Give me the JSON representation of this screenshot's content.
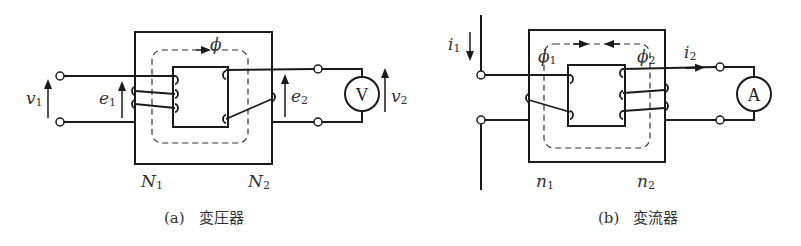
{
  "figure": {
    "panels": [
      {
        "id": "a",
        "caption_letter": "(a)",
        "caption_text": "変圧器",
        "meter_symbol": "V",
        "labels": {
          "input_voltage": "v",
          "input_voltage_sub": "1",
          "primary_emf": "e",
          "primary_emf_sub": "1",
          "secondary_emf": "e",
          "secondary_emf_sub": "2",
          "output_voltage": "v",
          "output_voltage_sub": "2",
          "flux": "ϕ",
          "primary_turns": "N",
          "primary_turns_sub": "1",
          "secondary_turns": "N",
          "secondary_turns_sub": "2"
        }
      },
      {
        "id": "b",
        "caption_letter": "(b)",
        "caption_text": "変流器",
        "meter_symbol": "A",
        "labels": {
          "primary_current": "i",
          "primary_current_sub": "1",
          "secondary_current": "i",
          "secondary_current_sub": "2",
          "flux1": "ϕ",
          "flux1_sub": "1",
          "flux2": "ϕ",
          "flux2_sub": "2",
          "primary_turns": "n",
          "primary_turns_sub": "1",
          "secondary_turns": "n",
          "secondary_turns_sub": "2"
        }
      }
    ]
  }
}
